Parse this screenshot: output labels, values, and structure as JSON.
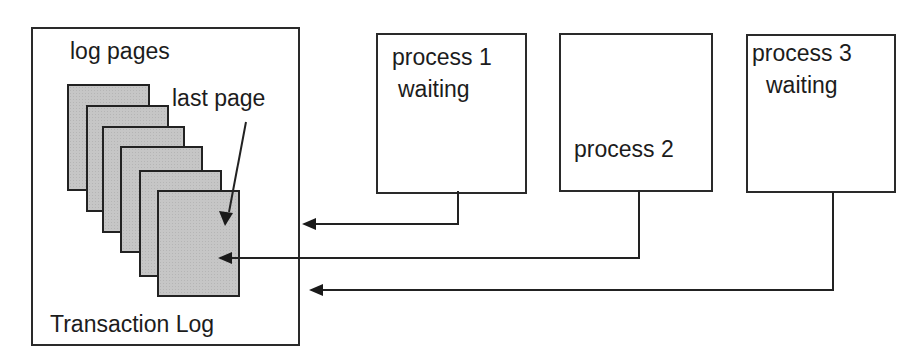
{
  "diagram": {
    "transaction_log": {
      "title": "Transaction Log",
      "pages_label": "log pages",
      "last_page_label": "last page",
      "page_count": 6
    },
    "processes": [
      {
        "id": 1,
        "name": "process 1",
        "status": "waiting"
      },
      {
        "id": 2,
        "name": "process 2",
        "status": ""
      },
      {
        "id": 3,
        "name": "process 3",
        "status": "waiting"
      }
    ],
    "arrows": [
      {
        "from": "process 1",
        "to": "transaction log (outside)"
      },
      {
        "from": "process 2",
        "to": "last page"
      },
      {
        "from": "process 3",
        "to": "transaction log (outside)"
      },
      {
        "from": "last page label",
        "to": "last page"
      }
    ],
    "colors": {
      "line": "#222222",
      "page_fill": "#c6c6c6",
      "background": "#ffffff"
    }
  }
}
